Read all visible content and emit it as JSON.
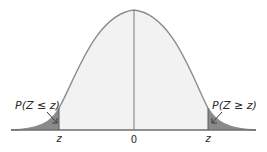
{
  "diagram": {
    "type": "normal-distribution",
    "left_tail_label": "P(Z ≤ z)",
    "right_tail_label": "P(Z ≥ z)",
    "tick_labels": {
      "left": "z",
      "center": "0",
      "right": "z"
    },
    "colors": {
      "curve_fill": "#f2f2f2",
      "tail_fill": "#8a8a8a",
      "curve_stroke": "#8c8c8c",
      "axis": "#6e6e6e",
      "text": "#2a2a2a"
    }
  }
}
